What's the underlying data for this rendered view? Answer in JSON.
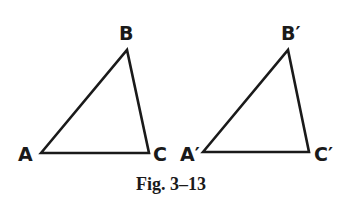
{
  "figure": {
    "caption": "Fig. 3–13",
    "triangles": [
      {
        "name": "ABC",
        "vertices": {
          "A": {
            "label": "A",
            "x": 41,
            "y": 153
          },
          "B": {
            "label": "B",
            "x": 127,
            "y": 50
          },
          "C": {
            "label": "C",
            "x": 149,
            "y": 153
          }
        }
      },
      {
        "name": "A'B'C'",
        "vertices": {
          "A": {
            "label": "A′",
            "x": 203,
            "y": 152
          },
          "B": {
            "label": "B′",
            "x": 288,
            "y": 50
          },
          "C": {
            "label": "C′",
            "x": 309,
            "y": 152
          }
        }
      }
    ],
    "stroke_color": "#1a1a1a"
  }
}
